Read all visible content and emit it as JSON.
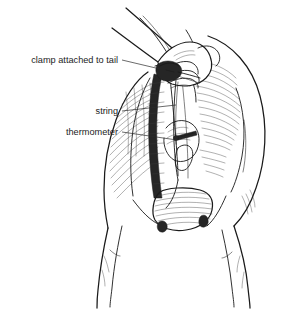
{
  "figure": {
    "background_color": "#ffffff",
    "ink_color": "#1a1a1a",
    "width": 291,
    "height": 311,
    "style": "pen-and-ink line drawing"
  },
  "labels": [
    {
      "id": "clamp",
      "text": "clamp attached to tail",
      "text_x": 118,
      "text_y": 63,
      "leader_path": "M122,60 L160,69",
      "target": "tail-clamp"
    },
    {
      "id": "string",
      "text": "string",
      "text_x": 118,
      "text_y": 114,
      "leader_path": "M122,111 L176,105",
      "target": "string-line"
    },
    {
      "id": "thermometer",
      "text": "thermometer",
      "text_x": 118,
      "text_y": 135,
      "leader_path": "M122,132 L177,140",
      "target": "thermometer-body"
    }
  ],
  "subject": {
    "animal": "cow",
    "view": "rear",
    "parts": [
      "tail",
      "hand",
      "rump",
      "hind-leg-left",
      "hind-leg-right",
      "udder",
      "anus",
      "clamp",
      "string",
      "thermometer"
    ]
  }
}
